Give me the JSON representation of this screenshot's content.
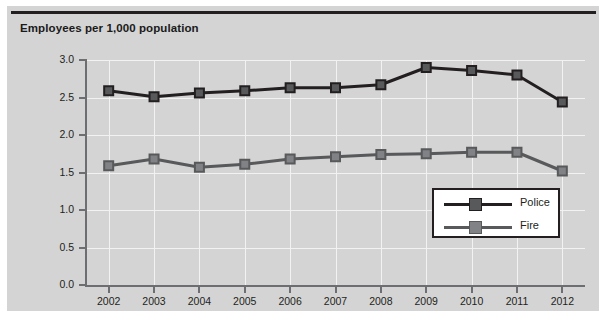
{
  "chart_data": {
    "type": "line",
    "title": "Employees per 1,000 population",
    "xlabel": "",
    "ylabel": "",
    "x": [
      "2002",
      "2003",
      "2004",
      "2005",
      "2006",
      "2007",
      "2008",
      "2009",
      "2010",
      "2011",
      "2012"
    ],
    "categories": [
      "2002",
      "2003",
      "2004",
      "2005",
      "2006",
      "2007",
      "2008",
      "2009",
      "2010",
      "2011",
      "2012"
    ],
    "series": [
      {
        "name": "Police",
        "color": "#231f20",
        "marker_color": "#58595b",
        "values": [
          2.59,
          2.51,
          2.56,
          2.59,
          2.63,
          2.63,
          2.67,
          2.9,
          2.86,
          2.8,
          2.44
        ]
      },
      {
        "name": "Fire",
        "color": "#58595b",
        "marker_color": "#808285",
        "values": [
          1.59,
          1.68,
          1.57,
          1.61,
          1.68,
          1.71,
          1.74,
          1.75,
          1.77,
          1.77,
          1.52
        ]
      }
    ],
    "ylim": [
      0.0,
      3.0
    ],
    "yticks": [
      "0.0",
      "0.5",
      "1.0",
      "1.5",
      "2.0",
      "2.5",
      "3.0"
    ],
    "ytick_values": [
      0.0,
      0.5,
      1.0,
      1.5,
      2.0,
      2.5,
      3.0
    ],
    "grid": true,
    "grid_color": "#f2f2f2",
    "legend_position": "center-right",
    "plot_background": "#d4d4d4",
    "figure_background": "#d4d4d4"
  }
}
